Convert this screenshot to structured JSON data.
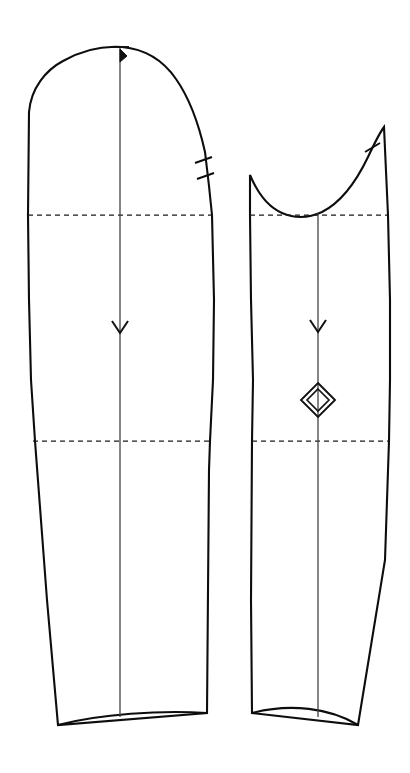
{
  "document": {
    "type": "sewing-pattern-technical-drawing",
    "title": "Two-piece sleeve pattern",
    "background_color": "#ffffff",
    "line_color": "#0d0d0d",
    "guide_color": "#1a1a1a",
    "grainline_color": "#3c3c3c",
    "width": 410,
    "height": 773
  },
  "pieces": [
    {
      "id": "upper-sleeve",
      "name": "upper-sleeve-piece",
      "position": "left",
      "outline_path": "M 29 112 C 31 88 46 70 63 61 C 86 48 108 46 122 47 C 144 49 163 60 176 79 C 190 99 199 125 205 152 L 209 186 L 212 215 L 214 300 L 213 380 L 210 441 L 209 470 L 207 713 L 58 725 L 47 600 L 35 441 L 31 380 L 29 300 L 28 215 Z",
      "hem_curve": "M 58 725 C 100 714 160 710 207 713",
      "grainline": {
        "x": 120,
        "y_top": 47,
        "y_bottom": 717
      },
      "notches": [
        {
          "type": "double-notch",
          "x": 204,
          "y": 160
        },
        {
          "type": "double-notch",
          "x": 207,
          "y": 176
        }
      ],
      "guide_lines": [
        {
          "label": "bicep-line",
          "y": 215,
          "x_start": 28,
          "x_end": 212
        },
        {
          "label": "elbow-line",
          "y": 441,
          "x_start": 33,
          "x_end": 210
        }
      ]
    },
    {
      "id": "under-sleeve",
      "name": "under-sleeve-piece",
      "position": "right",
      "outline_path": "M 250 175 C 258 194 268 207 282 213 C 296 219 309 218 322 212 C 340 203 356 182 368 157 C 376 140 381 131 384 127 L 388 215 L 390 300 L 390 380 L 389 441 L 385 560 L 358 725 L 252 713 L 251 600 L 252 441 L 253 380 L 251 300 L 250 215 Z",
      "hem_curve": "M 252 713 C 290 703 330 708 358 725",
      "grainline": {
        "x": 318,
        "y_top": 213,
        "y_bottom": 717
      },
      "notches": [
        {
          "type": "single-notch",
          "x": 372,
          "y": 148
        }
      ],
      "guide_lines": [
        {
          "label": "bicep-line",
          "y": 215,
          "x_start": 250,
          "x_end": 388
        },
        {
          "label": "elbow-line",
          "y": 441,
          "x_start": 252,
          "x_end": 389
        }
      ],
      "markers": [
        {
          "type": "double-diamond",
          "label": "balance-point-diamond",
          "x": 318,
          "y": 400,
          "outer_half_width": 17,
          "outer_half_height": 17,
          "inner_half_width": 11,
          "inner_half_height": 11
        }
      ]
    }
  ],
  "symbols": {
    "grainline_top_bar_label": "grainline-top-crossbar",
    "grainline_arrow_label": "grainline-direction-arrow",
    "notch_label": "seam-matching-notch",
    "diamond_label": "nested-diamond-marker",
    "dashed_label": "construction-guide-line"
  }
}
